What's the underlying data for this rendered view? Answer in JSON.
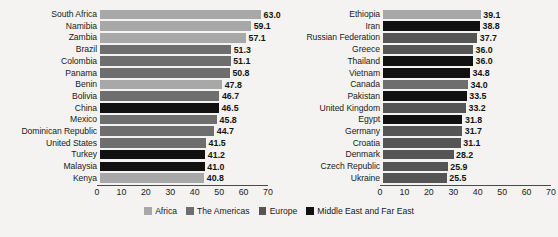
{
  "chart_data": {
    "type": "bar",
    "orientation": "horizontal",
    "title": "",
    "xlabel": "",
    "ylabel": "",
    "xlim": [
      0,
      70
    ],
    "xticks": [
      0,
      10,
      20,
      30,
      40,
      50,
      60,
      70
    ],
    "grid": false,
    "legend_position": "bottom-center",
    "legend": [
      {
        "name": "Africa",
        "color": "#a8a8a8"
      },
      {
        "name": "The Americas",
        "color": "#6e6e6e"
      },
      {
        "name": "Europe",
        "color": "#555555"
      },
      {
        "name": "Middle East and Far East",
        "color": "#111111"
      }
    ],
    "panels": [
      {
        "id": "left-panel",
        "categories": [
          "South Africa",
          "Namibia",
          "Zambia",
          "Brazil",
          "Colombia",
          "Panama",
          "Benin",
          "Bolivia",
          "China",
          "Mexico",
          "Dominican Republic",
          "United States",
          "Turkey",
          "Malaysia",
          "Kenya"
        ],
        "values": [
          63.0,
          59.1,
          57.1,
          51.3,
          51.1,
          50.8,
          47.8,
          46.7,
          46.5,
          45.8,
          44.7,
          41.5,
          41.2,
          41.0,
          40.8
        ],
        "value_labels": [
          "63.0",
          "59.1",
          "57.1",
          "51.3",
          "51.1",
          "50.8",
          "47.8",
          "46.7",
          "46.5",
          "45.8",
          "44.7",
          "41.5",
          "41.2",
          "41.0",
          "40.8"
        ],
        "groups": [
          "Africa",
          "Africa",
          "Africa",
          "The Americas",
          "The Americas",
          "The Americas",
          "Africa",
          "The Americas",
          "Middle East and Far East",
          "The Americas",
          "The Americas",
          "The Americas",
          "Middle East and Far East",
          "Middle East and Far East",
          "Africa"
        ]
      },
      {
        "id": "right-panel",
        "categories": [
          "Ethiopia",
          "Iran",
          "Russian Federation",
          "Greece",
          "Thailand",
          "Vietnam",
          "Canada",
          "Pakistan",
          "United Kingdom",
          "Egypt",
          "Germany",
          "Croatia",
          "Denmark",
          "Czech Republic",
          "Ukraine"
        ],
        "values": [
          39.1,
          38.8,
          37.7,
          36.0,
          36.0,
          34.8,
          34.0,
          33.5,
          33.2,
          31.8,
          31.7,
          31.1,
          28.2,
          25.9,
          25.5
        ],
        "value_labels": [
          "39.1",
          "38.8",
          "37.7",
          "36.0",
          "36.0",
          "34.8",
          "34.0",
          "33.5",
          "33.2",
          "31.8",
          "31.7",
          "31.1",
          "28.2",
          "25.9",
          "25.5"
        ],
        "groups": [
          "Africa",
          "Middle East and Far East",
          "Europe",
          "Europe",
          "Middle East and Far East",
          "Middle East and Far East",
          "The Americas",
          "Middle East and Far East",
          "Europe",
          "Middle East and Far East",
          "Europe",
          "Europe",
          "Europe",
          "Europe",
          "Europe"
        ]
      }
    ]
  }
}
